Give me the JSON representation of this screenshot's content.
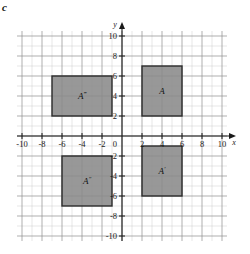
{
  "figure": {
    "part_label": "c",
    "background_color": "#ffffff",
    "grid_minor_color": "#c9c9c9",
    "grid_major_color": "#8c8c8c",
    "axis_color": "#1a1a1a",
    "shape_fill_color": "#8a8a8a",
    "shape_stroke_color": "#2b2b2b"
  },
  "chart_data": {
    "type": "scatter",
    "title": "",
    "xlabel": "x",
    "ylabel": "y",
    "xlim": [
      -10,
      10
    ],
    "ylim": [
      -10,
      10
    ],
    "grid": true,
    "legend": "none",
    "x_ticks": [
      -10,
      -8,
      -6,
      -4,
      -2,
      0,
      2,
      4,
      6,
      8,
      10
    ],
    "y_ticks": [
      -10,
      -8,
      -6,
      -4,
      -2,
      2,
      4,
      6,
      8,
      10
    ],
    "x_tick_labels": [
      "-10",
      "-8",
      "-6",
      "-4",
      "-2",
      "0",
      "2",
      "4",
      "6",
      "8",
      "10"
    ],
    "y_tick_labels": [
      "-10",
      "-8",
      "-6",
      "-4",
      "-2",
      "2",
      "4",
      "6",
      "8",
      "10"
    ],
    "origin_label": "0",
    "shapes": [
      {
        "name": "A",
        "label": "A",
        "primes": "",
        "x_min": 2,
        "x_max": 6,
        "y_min": 2,
        "y_max": 7,
        "label_x": 4,
        "label_y": 4.5
      },
      {
        "name": "A-prime",
        "label": "A",
        "primes": "′",
        "x_min": 2,
        "x_max": 6,
        "y_min": -6,
        "y_max": -1,
        "label_x": 4,
        "label_y": -3.5
      },
      {
        "name": "A-double-prime",
        "label": "A",
        "primes": "″",
        "x_min": -6,
        "x_max": -1,
        "y_min": -7,
        "y_max": -2,
        "label_x": -3.5,
        "label_y": -4.5
      },
      {
        "name": "A-triple-prime",
        "label": "A",
        "primes": "‴",
        "x_min": -7,
        "x_max": -1,
        "y_min": 2,
        "y_max": 6,
        "label_x": -4,
        "label_y": 4
      }
    ]
  }
}
